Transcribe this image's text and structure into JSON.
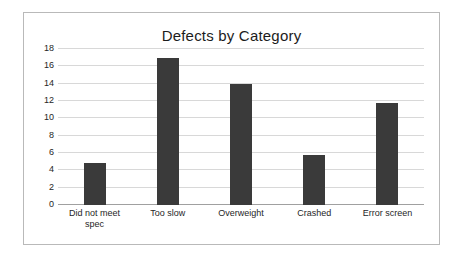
{
  "chart_data": {
    "type": "bar",
    "title": "Defects by Category",
    "xlabel": "",
    "ylabel": "",
    "categories": [
      "Did not meet spec",
      "Too slow",
      "Overweight",
      "Crashed",
      "Error screen"
    ],
    "values": [
      4.9,
      17,
      14,
      5.8,
      11.8
    ],
    "yticks": [
      0,
      2,
      4,
      6,
      8,
      10,
      12,
      14,
      16,
      18
    ],
    "ylim": [
      0,
      18
    ],
    "grid": true,
    "legend": false,
    "bar_color": "#3a3a3a",
    "grid_color": "#d8d8d8",
    "axis_color": "#a0a0a0",
    "background_color": "#ffffff",
    "border_color": "#b9b9b9"
  }
}
